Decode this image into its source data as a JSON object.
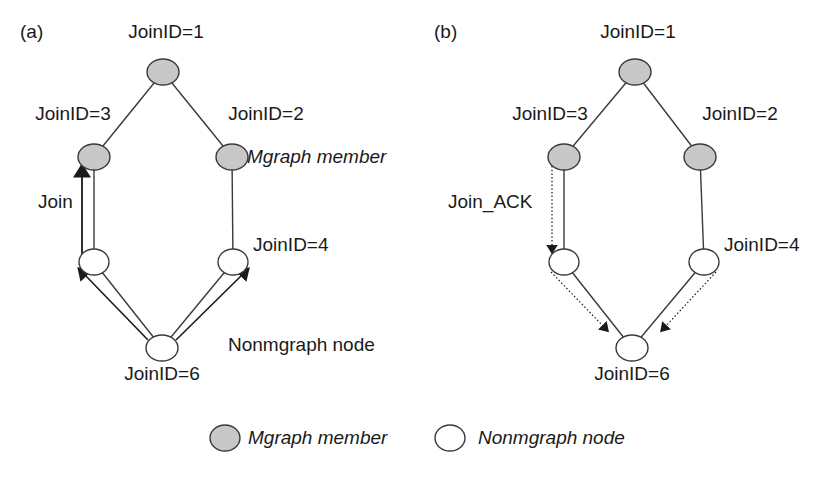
{
  "figure": {
    "background_color": "#ffffff",
    "node_fill_member": "#c8c8c8",
    "node_fill_nonmember": "#ffffff",
    "node_stroke": "#3a3a3a",
    "edge_color": "#3a3a3a",
    "arrow_color": "#1a1a1a"
  },
  "panels": [
    {
      "tag": "(a)",
      "message_label": "Join",
      "nodes": [
        {
          "id": "a-top",
          "label": "JoinID=1",
          "type": "mgraph-member",
          "cx": 163,
          "cy": 72,
          "label_x": 166,
          "label_y": 22,
          "label_align": "center"
        },
        {
          "id": "a-left",
          "label": "JoinID=3",
          "type": "mgraph-member",
          "cx": 94,
          "cy": 157,
          "label_x": 73,
          "label_y": 104,
          "label_align": "center"
        },
        {
          "id": "a-right",
          "label": "JoinID=2",
          "type": "mgraph-member",
          "cx": 232,
          "cy": 157,
          "label_x": 266,
          "label_y": 104,
          "label_align": "center"
        },
        {
          "id": "a-lleft",
          "label": "",
          "type": "nonmgraph-node",
          "cx": 94,
          "cy": 262,
          "label_x": 0,
          "label_y": 0,
          "label_align": "none"
        },
        {
          "id": "a-lright",
          "label": "JoinID=4",
          "type": "nonmgraph-node",
          "cx": 233,
          "cy": 262,
          "label_x": 253,
          "label_y": 235,
          "label_align": "left"
        },
        {
          "id": "a-bottom",
          "label": "JoinID=6",
          "type": "nonmgraph-node",
          "cx": 162,
          "cy": 348,
          "label_x": 162,
          "label_y": 364,
          "label_align": "center"
        }
      ],
      "annotations": [
        {
          "text": "Mgraph member",
          "x": 247,
          "y": 147,
          "style": "italic"
        },
        {
          "text": "Nonmgraph node",
          "x": 228,
          "y": 335,
          "style": "normal"
        }
      ]
    },
    {
      "tag": "(b)",
      "message_label": "Join_ACK",
      "nodes": [
        {
          "id": "b-top",
          "label": "JoinID=1",
          "type": "mgraph-member",
          "cx": 635,
          "cy": 72,
          "label_x": 638,
          "label_y": 22,
          "label_align": "center"
        },
        {
          "id": "b-left",
          "label": "JoinID=3",
          "type": "mgraph-member",
          "cx": 564,
          "cy": 157,
          "label_x": 550,
          "label_y": 104,
          "label_align": "center"
        },
        {
          "id": "b-right",
          "label": "JoinID=2",
          "type": "mgraph-member",
          "cx": 700,
          "cy": 157,
          "label_x": 740,
          "label_y": 104,
          "label_align": "center"
        },
        {
          "id": "b-lleft",
          "label": "",
          "type": "nonmgraph-node",
          "cx": 564,
          "cy": 262,
          "label_x": 0,
          "label_y": 0,
          "label_align": "none"
        },
        {
          "id": "b-lright",
          "label": "JoinID=4",
          "type": "nonmgraph-node",
          "cx": 704,
          "cy": 262,
          "label_x": 724,
          "label_y": 235,
          "label_align": "left"
        },
        {
          "id": "b-bottom",
          "label": "JoinID=6",
          "type": "nonmgraph-node",
          "cx": 632,
          "cy": 348,
          "label_x": 632,
          "label_y": 364,
          "label_align": "center"
        }
      ],
      "annotations": []
    }
  ],
  "panel_tag_positions": [
    {
      "x": 20,
      "y": 22
    },
    {
      "x": 434,
      "y": 22
    }
  ],
  "message_label_positions": [
    {
      "x": 38,
      "y": 192
    },
    {
      "x": 448,
      "y": 192
    }
  ],
  "legend": {
    "items": [
      {
        "swatch": "mgraph-member",
        "label": "Mgraph member",
        "cx": 225,
        "cy": 438,
        "text_x": 248,
        "text_y": 428
      },
      {
        "swatch": "nonmgraph-node",
        "label": "Nonmgraph node",
        "cx": 450,
        "cy": 438,
        "text_x": 478,
        "text_y": 428
      }
    ]
  }
}
